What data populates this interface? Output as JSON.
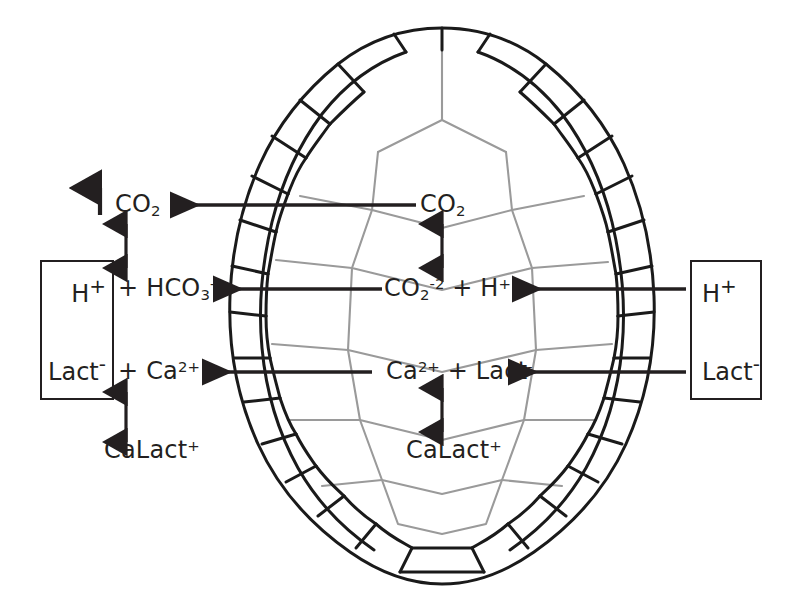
{
  "figure": {
    "kind": "turtle-shell-acid-base-buffering-diagram",
    "background_color": "#ffffff",
    "ink_color": "#231f20",
    "shell_outer_color": "#1a1a1a",
    "shell_inner_color": "#9a9a9a"
  },
  "labels": {
    "co2_exhaled": "CO",
    "co2_exhaled_sub": "2",
    "blood_h": "H",
    "blood_h_sup": "+",
    "blood_plus_hco3": " + HCO",
    "blood_hco3_sub": "3",
    "blood_hco3_sup": "-",
    "blood_lact": "Lact",
    "blood_lact_sup": "-",
    "blood_plus_ca": " + Ca",
    "blood_ca_sup": "2+",
    "blood_calact": "CaLact",
    "blood_calact_sup": "+",
    "shell_co2": "CO",
    "shell_co2_sub": "2",
    "shell_carbonate": "CO",
    "shell_carbonate_sub": "2",
    "shell_carbonate_sup": "-2",
    "shell_carbonate_plus_h": " + H",
    "shell_h_sup": "+",
    "shell_ca": "Ca",
    "shell_ca_sup": "2+",
    "shell_plus_lact": " + Lact",
    "shell_lact_sup": "-",
    "shell_calact": "CaLact",
    "shell_calact_sup": "+",
    "muscle_h": "H",
    "muscle_h_sup": "+",
    "muscle_lact": "Lact",
    "muscle_lact_sup": "-"
  },
  "arrows": {
    "exhale": {
      "name": "co2-exhalation-arrow",
      "direction": "up"
    },
    "co2_to_bicarbonate": {
      "name": "blood-co2-bicarbonate-equilibrium-arrow",
      "direction": "both"
    },
    "ca_lact_to_calact": {
      "name": "blood-calcium-lactate-equilibrium-arrow",
      "direction": "both"
    },
    "shell_co2_to_carbonate": {
      "name": "shell-co2-carbonate-equilibrium-arrow",
      "direction": "both"
    },
    "shell_ca_to_calact": {
      "name": "shell-calcium-lactate-equilibrium-arrow",
      "direction": "both"
    },
    "shell_co2_to_blood": {
      "name": "shell-to-blood-co2-arrow",
      "direction": "left"
    },
    "shell_carbonate_to_blood": {
      "name": "shell-to-blood-bicarbonate-arrow",
      "direction": "left"
    },
    "shell_calcium_to_blood": {
      "name": "shell-to-blood-calcium-arrow",
      "direction": "left"
    },
    "muscle_h_to_shell": {
      "name": "muscle-to-shell-proton-arrow",
      "direction": "left"
    },
    "muscle_lact_to_shell": {
      "name": "muscle-to-shell-lactate-arrow",
      "direction": "left"
    }
  },
  "boxes": {
    "blood": {
      "name": "blood-compartment-box"
    },
    "muscle": {
      "name": "muscle-compartment-box"
    }
  }
}
